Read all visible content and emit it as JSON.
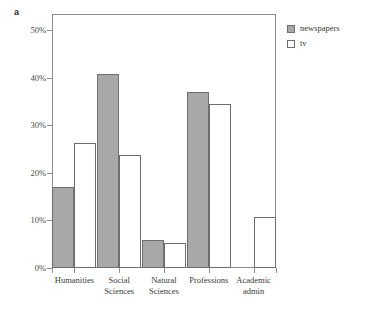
{
  "panel": {
    "label": "a"
  },
  "caption": {
    "text": ""
  },
  "legend": {
    "position": "top-right",
    "items": [
      {
        "label": "newspapers",
        "swatch": "newspapers-swatch",
        "color": "#a8a8a8"
      },
      {
        "label": "tv",
        "swatch": "tv-swatch",
        "color": "#ffffff"
      }
    ]
  },
  "axis": {
    "y_ticks": [
      {
        "label": "0%",
        "value": 0
      },
      {
        "label": "10%",
        "value": 10
      },
      {
        "label": "20%",
        "value": 20
      },
      {
        "label": "30%",
        "value": 30
      },
      {
        "label": "40%",
        "value": 40
      },
      {
        "label": "50%",
        "value": 50
      }
    ],
    "x_labels": [
      "Humanities",
      "Social\nSciences",
      "Natural\nSciences",
      "Professions",
      "Academic\nadmin"
    ]
  },
  "chart_data": {
    "type": "bar",
    "title": "",
    "subtitle": "",
    "xlabel": "",
    "ylabel": "",
    "ylim": [
      0,
      52
    ],
    "yticks": [
      0,
      10,
      20,
      30,
      40,
      50
    ],
    "ytick_labels": [
      "0%",
      "10%",
      "20%",
      "30%",
      "40%",
      "50%"
    ],
    "grid": false,
    "legend_position": "top-right",
    "categories": [
      "Humanities",
      "Social Sciences",
      "Natural Sciences",
      "Professions",
      "Academic admin"
    ],
    "series": [
      {
        "name": "newspapers",
        "color": "#a8a8a8",
        "values": [
          17.1,
          40.7,
          5.9,
          37.0,
          0
        ]
      },
      {
        "name": "tv",
        "color": "#ffffff",
        "values": [
          26.3,
          23.7,
          5.3,
          34.4,
          10.8
        ]
      }
    ],
    "units": "percent"
  }
}
